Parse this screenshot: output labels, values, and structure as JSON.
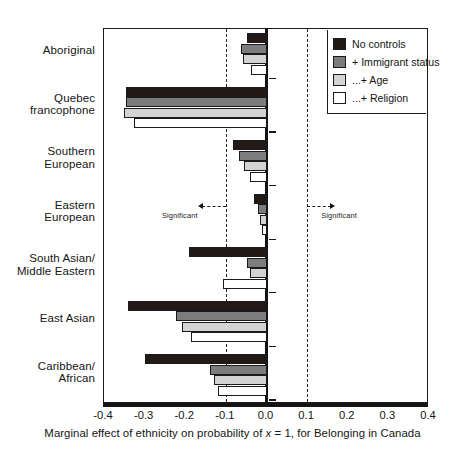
{
  "chart_data": {
    "type": "bar",
    "orientation": "horizontal",
    "title": "",
    "xlabel": "Marginal effect of ethnicity on probability of x = 1, for Belonging in Canada",
    "ylabel": "",
    "xlim": [
      -0.4,
      0.4
    ],
    "xticks": [
      "-0.4",
      "-0.3",
      "-0.2",
      "-0.1",
      "0.0",
      "0.1",
      "0.2",
      "0.3",
      "0.4"
    ],
    "xtick_values": [
      -0.4,
      -0.3,
      -0.2,
      -0.1,
      0.0,
      0.1,
      0.2,
      0.3,
      0.4
    ],
    "grid": false,
    "legend_position": "top-right",
    "categories": [
      "Aboriginal",
      "Quebec francophone",
      "Southern European",
      "Eastern European",
      "South Asian/ Middle Eastern",
      "East Asian",
      "Caribbean/ African"
    ],
    "series": [
      {
        "name": "No controls",
        "color": "#231a17",
        "values": [
          -0.048,
          -0.345,
          -0.082,
          -0.032,
          -0.19,
          -0.34,
          -0.3
        ]
      },
      {
        "name": "+ Immigrant status",
        "color": "#7c7c7c",
        "values": [
          -0.063,
          -0.345,
          -0.068,
          -0.022,
          -0.048,
          -0.222,
          -0.14
        ]
      },
      {
        "name": "...+ Age",
        "color": "#d3d3d3",
        "values": [
          -0.057,
          -0.35,
          -0.055,
          -0.016,
          -0.04,
          -0.208,
          -0.13
        ]
      },
      {
        "name": "...+ Religion",
        "color": "#ffffff",
        "values": [
          -0.038,
          -0.325,
          -0.04,
          -0.01,
          -0.108,
          -0.186,
          -0.12
        ]
      }
    ],
    "reference_lines": [
      {
        "value": -0.1,
        "style": "dashed",
        "label": "Significant"
      },
      {
        "value": 0.1,
        "style": "dashed",
        "label": "Significant"
      },
      {
        "value": 0.0,
        "style": "solid",
        "label": ""
      }
    ],
    "annotations": [
      {
        "text": "Significant",
        "direction": "left",
        "at": -0.1
      },
      {
        "text": "Significant",
        "direction": "right",
        "at": 0.1
      }
    ]
  },
  "legend": {
    "items": [
      {
        "label": "No controls"
      },
      {
        "label": "+ Immigrant status"
      },
      {
        "label": "...+ Age"
      },
      {
        "label": "...+ Religion"
      }
    ]
  },
  "axis": {
    "xlabel_prefix": "Marginal effect of ethnicity on probability of ",
    "xlabel_italic": "x",
    "xlabel_suffix": " = 1, for Belonging in Canada"
  },
  "categories_display": [
    {
      "lines": [
        "Aboriginal"
      ]
    },
    {
      "lines": [
        "Quebec",
        "francophone"
      ]
    },
    {
      "lines": [
        "Southern",
        "European"
      ]
    },
    {
      "lines": [
        "Eastern",
        "European"
      ]
    },
    {
      "lines": [
        "South Asian/",
        "Middle Eastern"
      ]
    },
    {
      "lines": [
        "East Asian"
      ]
    },
    {
      "lines": [
        "Caribbean/",
        "African"
      ]
    }
  ]
}
